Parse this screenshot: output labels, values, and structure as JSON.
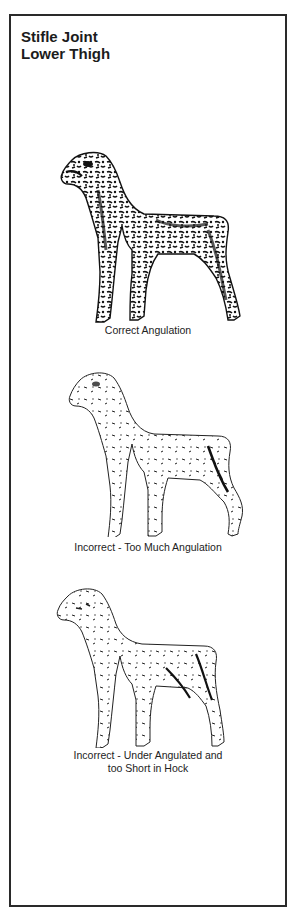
{
  "document": {
    "title_lines": [
      "Stifle Joint",
      "Lower Thigh"
    ]
  },
  "figures": [
    {
      "id": "correct",
      "caption_lines": [
        "Correct Angulation"
      ],
      "shading": "dark"
    },
    {
      "id": "too-much",
      "caption_lines": [
        "Incorrect - Too Much Angulation"
      ],
      "shading": "light"
    },
    {
      "id": "under",
      "caption_lines": [
        "Incorrect - Under Angulated and",
        "too Short in Hock"
      ],
      "shading": "light"
    }
  ],
  "colors": {
    "ink": "#1a1a1a",
    "border": "#2a2a2a",
    "paper": "#ffffff"
  }
}
